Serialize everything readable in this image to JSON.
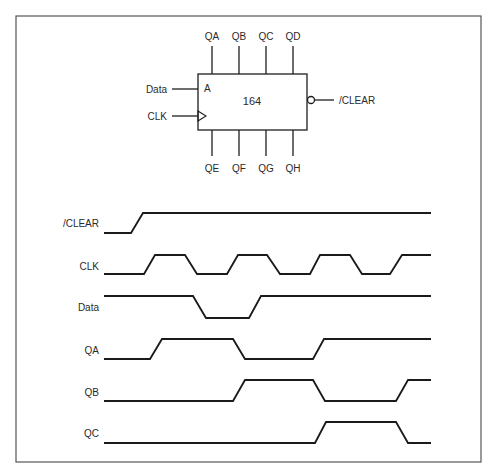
{
  "diagram": {
    "type": "timing-diagram",
    "chip": {
      "part_number": "164",
      "inputs": [
        {
          "label": "Data",
          "pin": "A"
        },
        {
          "label": "CLK",
          "pin": "clock"
        }
      ],
      "clear_label": "/CLEAR",
      "outputs_top": [
        "QA",
        "QB",
        "QC",
        "QD"
      ],
      "outputs_bottom": [
        "QE",
        "QF",
        "QG",
        "QH"
      ]
    },
    "pin_A_label": "A",
    "signals": [
      {
        "name": "/CLEAR",
        "transitions": "low, then high"
      },
      {
        "name": "CLK",
        "transitions": "square clock, 4 rising edges"
      },
      {
        "name": "Data",
        "transitions": "high, low pulse, high"
      },
      {
        "name": "QA",
        "transitions": "low, high, low, high"
      },
      {
        "name": "QB",
        "transitions": "low, high, low, high"
      },
      {
        "name": "QC",
        "transitions": "low, high, low"
      }
    ]
  }
}
